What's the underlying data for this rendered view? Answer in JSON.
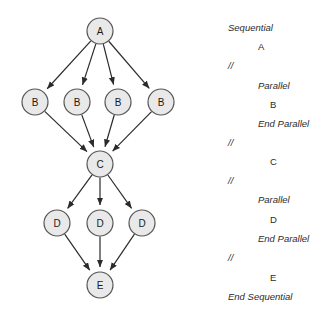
{
  "diagram": {
    "node_fill": "#e9e9e9",
    "node_stroke": "#555555",
    "edge_color": "#2b2b2b",
    "background": "#ffffff",
    "nodes": [
      {
        "id": "A",
        "label": "A",
        "cx": 100,
        "cy": 31,
        "r": 13
      },
      {
        "id": "B1",
        "label": "B",
        "cx": 35,
        "cy": 102,
        "r": 13
      },
      {
        "id": "B2",
        "label": "B",
        "cx": 77,
        "cy": 102,
        "r": 13
      },
      {
        "id": "B3",
        "label": "B",
        "cx": 118,
        "cy": 102,
        "r": 13
      },
      {
        "id": "B4",
        "label": "B",
        "cx": 161,
        "cy": 102,
        "r": 13
      },
      {
        "id": "C",
        "label": "C",
        "cx": 100,
        "cy": 164,
        "r": 13
      },
      {
        "id": "D1",
        "label": "D",
        "cx": 57,
        "cy": 223,
        "r": 13
      },
      {
        "id": "D2",
        "label": "D",
        "cx": 100,
        "cy": 223,
        "r": 13
      },
      {
        "id": "D3",
        "label": "D",
        "cx": 142,
        "cy": 223,
        "r": 13
      },
      {
        "id": "E",
        "label": "E",
        "cx": 100,
        "cy": 285,
        "r": 13
      }
    ],
    "edges": [
      {
        "from": "A",
        "to": "B1"
      },
      {
        "from": "A",
        "to": "B2"
      },
      {
        "from": "A",
        "to": "B3"
      },
      {
        "from": "A",
        "to": "B4"
      },
      {
        "from": "B1",
        "to": "C"
      },
      {
        "from": "B2",
        "to": "C"
      },
      {
        "from": "B3",
        "to": "C"
      },
      {
        "from": "B4",
        "to": "C"
      },
      {
        "from": "C",
        "to": "D1"
      },
      {
        "from": "C",
        "to": "D2"
      },
      {
        "from": "C",
        "to": "D3"
      },
      {
        "from": "D1",
        "to": "E"
      },
      {
        "from": "D2",
        "to": "E"
      },
      {
        "from": "D3",
        "to": "E"
      }
    ]
  },
  "pseudocode": {
    "lines": [
      {
        "text": "Sequential",
        "indent": 0,
        "style": "kw",
        "y": 30
      },
      {
        "text": "A",
        "indent": 2,
        "style": "task",
        "y": 49
      },
      {
        "text": "//",
        "indent": 0,
        "style": "sep",
        "y": 68
      },
      {
        "text": "Parallel",
        "indent": 2,
        "style": "kw",
        "y": 88
      },
      {
        "text": "B",
        "indent": 3,
        "style": "task",
        "y": 107
      },
      {
        "text": "End Parallel",
        "indent": 2,
        "style": "kw",
        "y": 126
      },
      {
        "text": "//",
        "indent": 0,
        "style": "sep",
        "y": 145
      },
      {
        "text": "C",
        "indent": 3,
        "style": "task",
        "y": 164
      },
      {
        "text": "//",
        "indent": 0,
        "style": "sep",
        "y": 183
      },
      {
        "text": "Parallel",
        "indent": 2,
        "style": "kw",
        "y": 202
      },
      {
        "text": "D",
        "indent": 3,
        "style": "task",
        "y": 222
      },
      {
        "text": "End Parallel",
        "indent": 2,
        "style": "kw",
        "y": 241
      },
      {
        "text": "//",
        "indent": 0,
        "style": "sep",
        "y": 260
      },
      {
        "text": "E",
        "indent": 3,
        "style": "task",
        "y": 280
      },
      {
        "text": "End Sequential",
        "indent": 0,
        "style": "kw",
        "y": 299
      }
    ],
    "indent_px": [
      28,
      40,
      58,
      70
    ]
  }
}
